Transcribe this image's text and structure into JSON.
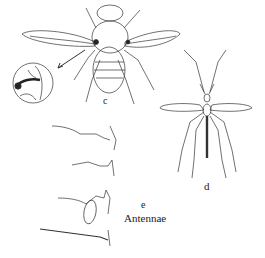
{
  "figure": {
    "labels": {
      "c": "c",
      "d": "d",
      "e": "e",
      "antennae": "Antennae"
    },
    "colors": {
      "ink": "#222222",
      "background": "#ffffff"
    }
  }
}
